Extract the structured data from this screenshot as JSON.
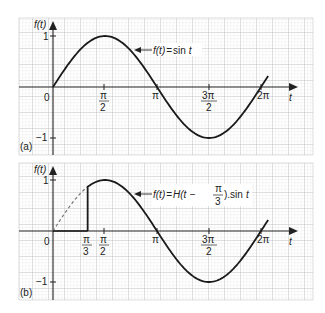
{
  "chart_data": [
    {
      "panel": "(a)",
      "type": "line",
      "title": "",
      "xlabel": "t",
      "ylabel": "f(t)",
      "annotation": "f(t) = sin t",
      "x_ticks": [
        "0",
        "π/2",
        "π",
        "3π/2",
        "2π"
      ],
      "x_tick_values": [
        0,
        1.5708,
        3.1416,
        4.7124,
        6.2832
      ],
      "y_ticks": [
        "1",
        "−1"
      ],
      "y_tick_values": [
        1,
        -1
      ],
      "xlim": [
        -1.0,
        7.8
      ],
      "ylim": [
        -1.35,
        1.45
      ],
      "grid": true,
      "series": [
        {
          "name": "f(t) = sin t",
          "style": "solid",
          "x_range": [
            0,
            6.5
          ],
          "function": "sin(t)"
        }
      ]
    },
    {
      "panel": "(b)",
      "type": "line",
      "title": "",
      "xlabel": "t",
      "ylabel": "f(t)",
      "annotation": "f(t) = H(t − π/3).sin t",
      "x_ticks": [
        "0",
        "π/3",
        "π/2",
        "π",
        "3π/2",
        "2π"
      ],
      "x_tick_values": [
        0,
        1.0472,
        1.5708,
        3.1416,
        4.7124,
        6.2832
      ],
      "y_ticks": [
        "1",
        "−1"
      ],
      "y_tick_values": [
        1,
        -1
      ],
      "xlim": [
        -1.0,
        7.8
      ],
      "ylim": [
        -1.35,
        1.45
      ],
      "grid": true,
      "series": [
        {
          "name": "sin t (suppressed part)",
          "style": "dashed",
          "x_range": [
            0,
            1.0472
          ],
          "function": "sin(t)"
        },
        {
          "name": "zero segment",
          "style": "solid",
          "x_range": [
            0,
            1.0472
          ],
          "function": "0"
        },
        {
          "name": "step jump",
          "style": "solid",
          "x": 1.0472,
          "y_range": [
            0,
            0.866
          ]
        },
        {
          "name": "f(t) = H(t − π/3).sin t",
          "style": "solid",
          "x_range": [
            1.0472,
            6.5
          ],
          "function": "sin(t)"
        }
      ]
    }
  ],
  "panels": {
    "a": {
      "tag": "(a)",
      "ylabel": "f(t)",
      "xlabel": "t",
      "y_one": "1",
      "y_minus_one": "−1",
      "origin": "0",
      "ann": {
        "lhs": "f(t)",
        "eq": "=",
        "rhs": "sin",
        "var": "t"
      },
      "ticks": {
        "pi2_num": "π",
        "pi2_den": "2",
        "pi": "π",
        "pi32_num": "3π",
        "pi32_den": "2",
        "two_pi": "2π"
      }
    },
    "b": {
      "tag": "(b)",
      "ylabel": "f(t)",
      "xlabel": "t",
      "y_one": "1",
      "y_minus_one": "−1",
      "origin": "0",
      "ann": {
        "lhs": "f(t)",
        "eq": "=",
        "h": "H(t −",
        "frac_num": "π",
        "frac_den": "3",
        "rhs": ").sin",
        "var": "t"
      },
      "ticks": {
        "pi3_num": "π",
        "pi3_den": "3",
        "pi2_num": "π",
        "pi2_den": "2",
        "pi": "π",
        "pi32_num": "3π",
        "pi32_den": "2",
        "two_pi": "2π"
      }
    }
  }
}
